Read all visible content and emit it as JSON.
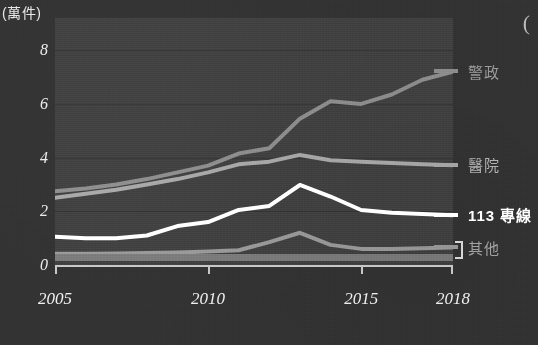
{
  "figure": {
    "unit_label": "(萬件)",
    "corner_mark": "("
  },
  "axes": {
    "y_ticks": [
      "0",
      "2",
      "4",
      "6",
      "8"
    ],
    "y_tick_values": [
      0,
      2,
      4,
      6,
      8
    ],
    "y_min": 0,
    "y_max": 9.2,
    "x_ticks": [
      "2005",
      "2010",
      "2015",
      "2018"
    ],
    "x_tick_values": [
      2005,
      2010,
      2015,
      2018
    ],
    "x_min": 2005,
    "x_max": 2018
  },
  "legend": [
    {
      "label": "警政",
      "color": "#8e8e8e",
      "name": "police"
    },
    {
      "label": "醫院",
      "color": "#a8a8a8",
      "name": "hospital"
    },
    {
      "label": "113 專線",
      "color": "#ffffff",
      "name": "hotline-113"
    },
    {
      "label": "其他",
      "color": "#9a9a9a",
      "name": "other"
    }
  ],
  "chart_data": {
    "type": "line",
    "title": "",
    "subtitle": "",
    "xlabel": "",
    "ylabel": "(萬件)",
    "xlim": [
      2005,
      2018
    ],
    "ylim": [
      0,
      9.2
    ],
    "grid": true,
    "legend_position": "right",
    "x": [
      2005,
      2006,
      2007,
      2008,
      2009,
      2010,
      2011,
      2012,
      2013,
      2014,
      2015,
      2016,
      2017,
      2018
    ],
    "series": [
      {
        "name": "警政",
        "color": "#8e8e8e",
        "width": 4,
        "values": [
          2.75,
          2.85,
          3.0,
          3.2,
          3.45,
          3.7,
          4.15,
          4.35,
          5.45,
          6.1,
          6.0,
          6.35,
          6.9,
          7.2
        ]
      },
      {
        "name": "醫院",
        "color": "#a8a8a8",
        "width": 4,
        "values": [
          2.5,
          2.65,
          2.8,
          3.0,
          3.2,
          3.45,
          3.75,
          3.85,
          4.1,
          3.9,
          3.85,
          3.8,
          3.75,
          3.72
        ]
      },
      {
        "name": "113 專線",
        "color": "#ffffff",
        "width": 4,
        "values": [
          1.05,
          1.0,
          1.0,
          1.1,
          1.45,
          1.6,
          2.05,
          2.2,
          2.98,
          2.55,
          2.05,
          1.95,
          1.9,
          1.85
        ]
      },
      {
        "name": "其他",
        "color": "#9a9a9a",
        "width": 4,
        "values": [
          0.42,
          0.42,
          0.43,
          0.45,
          0.47,
          0.5,
          0.55,
          0.85,
          1.2,
          0.75,
          0.6,
          0.6,
          0.62,
          0.65
        ]
      },
      {
        "name": "其他-band",
        "color": "#7c7c7c",
        "width": 7,
        "values": [
          0.28,
          0.28,
          0.28,
          0.28,
          0.28,
          0.28,
          0.28,
          0.28,
          0.28,
          0.28,
          0.28,
          0.28,
          0.28,
          0.28
        ]
      }
    ]
  }
}
